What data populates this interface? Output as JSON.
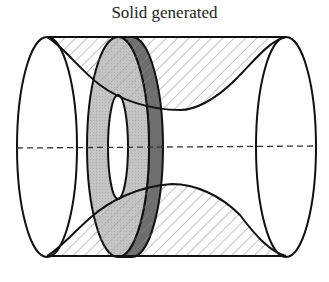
{
  "title": "Solid generated",
  "figure": {
    "colors": {
      "outline": "#111111",
      "hatch": "#9a9a9a",
      "washer_face": "#c4c4c4",
      "washer_edge": "#6e6e6e",
      "background": "#ffffff"
    },
    "parts": [
      "left-end-ellipse",
      "right-end-ellipse",
      "top-curve",
      "bottom-curve",
      "washer",
      "washer-hole",
      "axis-of-revolution"
    ]
  }
}
